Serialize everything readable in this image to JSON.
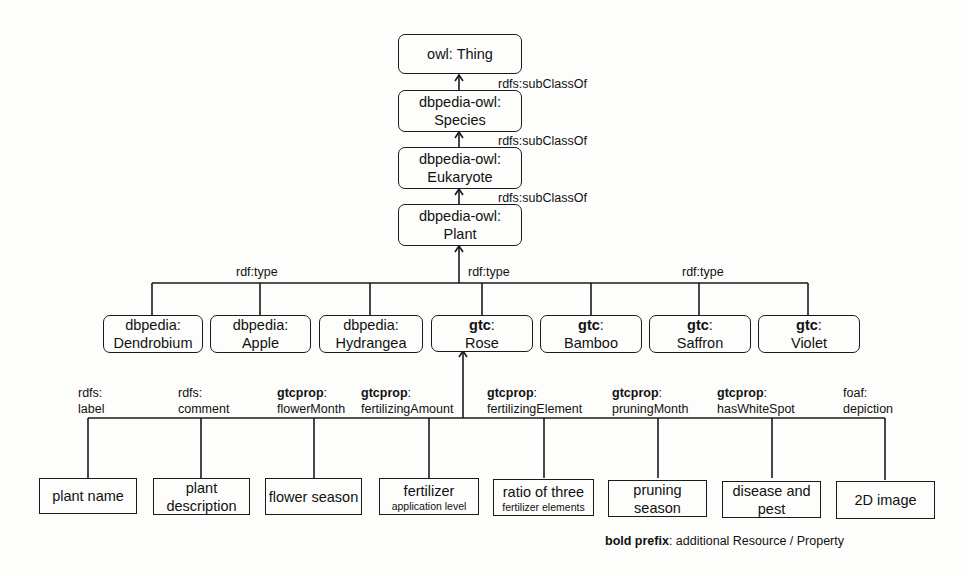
{
  "hierarchy": [
    {
      "line1": "owl: Thing",
      "line2": ""
    },
    {
      "line1": "dbpedia-owl:",
      "line2": "Species"
    },
    {
      "line1": "dbpedia-owl:",
      "line2": "Eukaryote"
    },
    {
      "line1": "dbpedia-owl:",
      "line2": "Plant"
    }
  ],
  "subclass_labels": [
    "rdfs:subClassOf",
    "rdfs:subClassOf",
    "rdfs:subClassOf"
  ],
  "type_labels": [
    "rdf:type",
    "rdf:type",
    "rdf:type"
  ],
  "instances": [
    {
      "prefix": "dbpedia",
      "name": "Dendrobium",
      "bold": false
    },
    {
      "prefix": "dbpedia",
      "name": "Apple",
      "bold": false
    },
    {
      "prefix": "dbpedia",
      "name": "Hydrangea",
      "bold": false
    },
    {
      "prefix": "gtc",
      "name": "Rose",
      "bold": true
    },
    {
      "prefix": "gtc",
      "name": "Bamboo",
      "bold": true
    },
    {
      "prefix": "gtc",
      "name": "Saffron",
      "bold": true
    },
    {
      "prefix": "gtc",
      "name": "Violet",
      "bold": true
    }
  ],
  "properties": [
    {
      "prefix": "rdfs",
      "name": "label",
      "bold": false
    },
    {
      "prefix": "rdfs",
      "name": "comment",
      "bold": false
    },
    {
      "prefix": "gtcprop",
      "name": "flowerMonth",
      "bold": true
    },
    {
      "prefix": "gtcprop",
      "name": "fertilizingAmount",
      "bold": true
    },
    {
      "prefix": "gtcprop",
      "name": "fertilizingElement",
      "bold": true
    },
    {
      "prefix": "gtcprop",
      "name": "pruningMonth",
      "bold": true
    },
    {
      "prefix": "gtcprop",
      "name": "hasWhiteSpot",
      "bold": true
    },
    {
      "prefix": "foaf",
      "name": "depiction",
      "bold": false
    }
  ],
  "values": [
    {
      "line1": "plant name",
      "line2": "",
      "small": false
    },
    {
      "line1": "plant",
      "line2": "description",
      "small": false
    },
    {
      "line1": "flower season",
      "line2": "",
      "small": false
    },
    {
      "line1": "fertilizer",
      "line2": "application level",
      "small": true
    },
    {
      "line1": "ratio of three",
      "line2": "fertilizer elements",
      "small": true
    },
    {
      "line1": "pruning",
      "line2": "season",
      "small": false
    },
    {
      "line1": "disease and",
      "line2": "pest",
      "small": false
    },
    {
      "line1": "2D image",
      "line2": "",
      "small": false
    }
  ],
  "legend": {
    "bold_part": "bold prefix",
    "rest": ": additional Resource / Property"
  },
  "colors": {
    "line": "#1a1a1a",
    "background": "#fdfdfc"
  }
}
